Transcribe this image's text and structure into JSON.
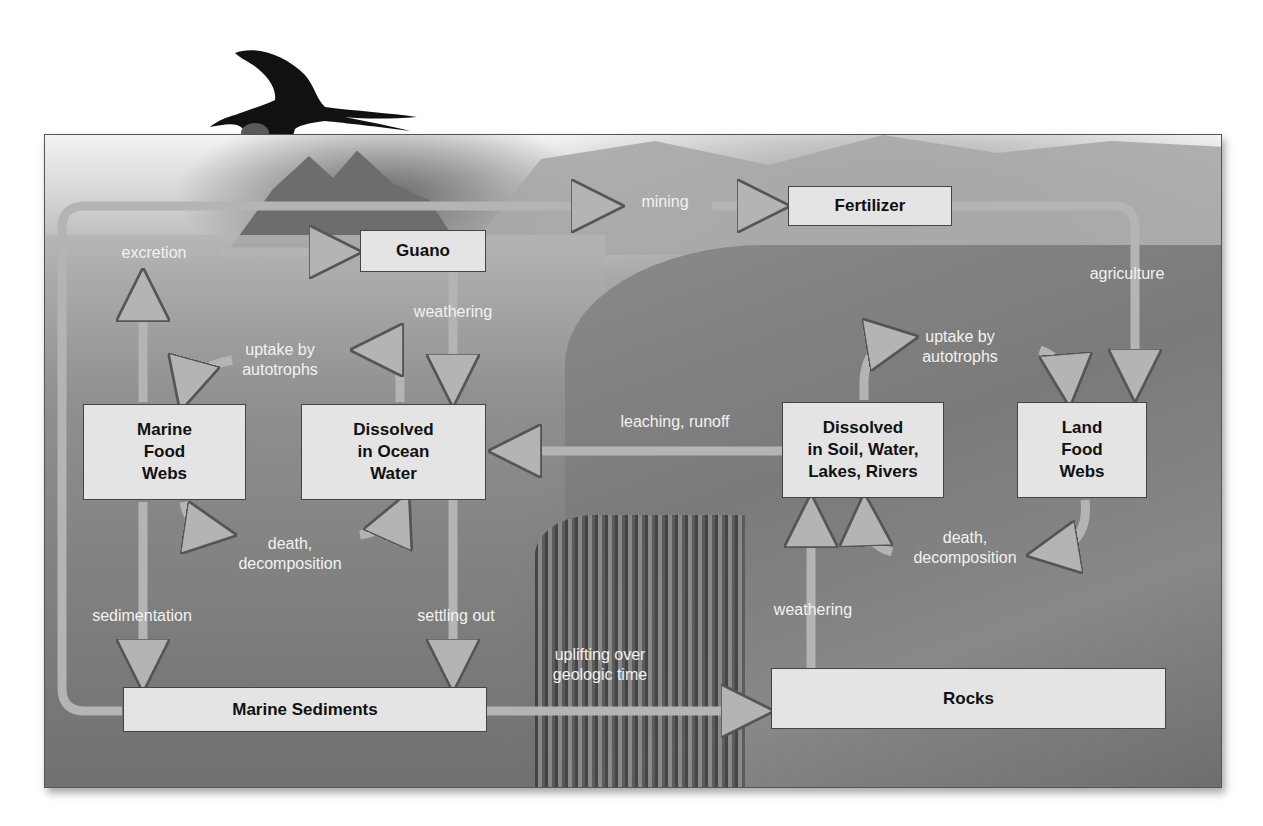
{
  "diagram": {
    "nodes": {
      "guano": "Guano",
      "fertilizer": "Fertilizer",
      "marine_food_webs": "Marine\nFood\nWebs",
      "dissolved_ocean": "Dissolved\nin Ocean\nWater",
      "dissolved_soil": "Dissolved\nin Soil, Water,\nLakes, Rivers",
      "land_food_webs": "Land\nFood\nWebs",
      "marine_sediments": "Marine Sediments",
      "rocks": "Rocks"
    },
    "process_labels": {
      "excretion": "excretion",
      "mining": "mining",
      "weathering_guano": "weathering",
      "agriculture": "agriculture",
      "uptake_marine": "uptake by\nautotrophs",
      "uptake_land": "uptake by\nautotrophs",
      "leaching": "leaching, runoff",
      "death_marine": "death,\ndecomposition",
      "death_land": "death,\ndecomposition",
      "sedimentation": "sedimentation",
      "settling_out": "settling out",
      "uplifting": "uplifting over\ngeologic time",
      "weathering_rocks": "weathering"
    },
    "colors": {
      "box_fill": "#e4e4e4",
      "arrow_fill": "#b4b4b4",
      "label_text": "#f2f2f2"
    },
    "edges": [
      {
        "from": "Marine Food Webs",
        "to": "Guano",
        "label": "excretion"
      },
      {
        "from": "Marine Sediments",
        "to": "Fertilizer",
        "label": "mining"
      },
      {
        "from": "Guano",
        "to": "Dissolved in Ocean Water",
        "label": "weathering"
      },
      {
        "from": "Fertilizer",
        "to": "Land Food Webs",
        "label": "agriculture"
      },
      {
        "from": "Dissolved in Ocean Water",
        "to": "Marine Food Webs",
        "label": "uptake by autotrophs"
      },
      {
        "from": "Marine Food Webs",
        "to": "Dissolved in Ocean Water",
        "label": "death, decomposition"
      },
      {
        "from": "Dissolved in Soil, Water, Lakes, Rivers",
        "to": "Dissolved in Ocean Water",
        "label": "leaching, runoff"
      },
      {
        "from": "Dissolved in Soil, Water, Lakes, Rivers",
        "to": "Land Food Webs",
        "label": "uptake by autotrophs"
      },
      {
        "from": "Land Food Webs",
        "to": "Dissolved in Soil, Water, Lakes, Rivers",
        "label": "death, decomposition"
      },
      {
        "from": "Marine Food Webs",
        "to": "Marine Sediments",
        "label": "sedimentation"
      },
      {
        "from": "Dissolved in Ocean Water",
        "to": "Marine Sediments",
        "label": "settling out"
      },
      {
        "from": "Marine Sediments",
        "to": "Rocks",
        "label": "uplifting over geologic time"
      },
      {
        "from": "Rocks",
        "to": "Dissolved in Soil, Water, Lakes, Rivers",
        "label": "weathering"
      }
    ]
  }
}
